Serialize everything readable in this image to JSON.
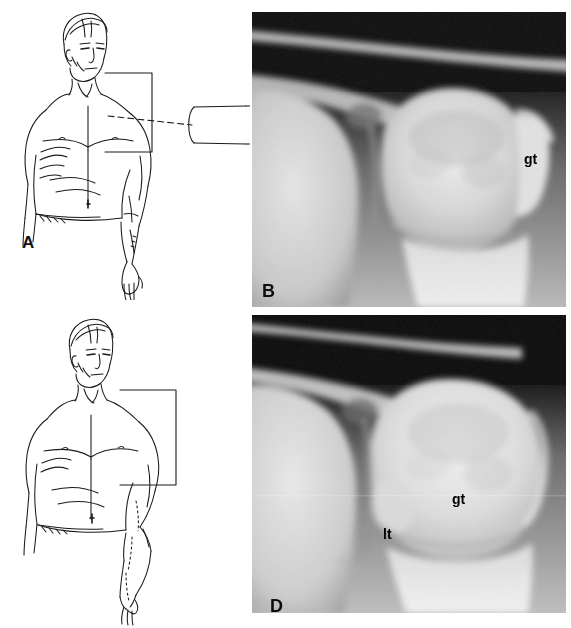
{
  "figure": {
    "width": 571,
    "height": 628,
    "background": "#ffffff",
    "type": "medical-figure-four-panel"
  },
  "panels": [
    {
      "id": "A",
      "letter": "A",
      "kind": "line-drawing",
      "description": "Anterior view line drawing of a male patient standing, arm at the side in external rotation, with cassette placed behind the shoulder and the x-ray tube directed horizontally at the shoulder",
      "elements": {
        "cassette": "rectangle-behind-shoulder",
        "beam": "dashed-horizontal-central-ray",
        "tube": "collimator-cylinder"
      }
    },
    {
      "id": "B",
      "letter": "B",
      "kind": "radiograph",
      "description": "AP shoulder radiograph in external rotation showing the greater tuberosity in profile laterally",
      "labels": [
        {
          "text": "gt",
          "meaning": "greater tuberosity"
        }
      ]
    },
    {
      "id": "C",
      "letter": "C",
      "kind": "line-drawing",
      "description": "Anterior view line drawing of a male patient standing, arm internally rotated with the forearm flexed across the abdomen, cassette placed behind the shoulder",
      "elements": {
        "cassette": "rectangle-behind-shoulder",
        "beam": "none-shown",
        "tube": "none-shown"
      }
    },
    {
      "id": "D",
      "letter": "D",
      "kind": "radiograph",
      "description": "AP shoulder radiograph in internal rotation showing the lesser tuberosity medially and the greater tuberosity overlying the humeral head",
      "labels": [
        {
          "text": "gt",
          "meaning": "greater tuberosity"
        },
        {
          "text": "lt",
          "meaning": "lesser tuberosity"
        }
      ]
    }
  ],
  "plate_letters": {
    "a": "A",
    "b": "B",
    "c": "C",
    "d": "D"
  },
  "bone_labels": {
    "gt_b": "gt",
    "gt_d": "gt",
    "lt_d": "lt"
  },
  "colors": {
    "page_background": "#ffffff",
    "ink": "#1a1a1a",
    "film_dark": "#0a0a0a",
    "film_bright": "#f2f2f2",
    "label_text": "#000000"
  },
  "caption_strip": ""
}
